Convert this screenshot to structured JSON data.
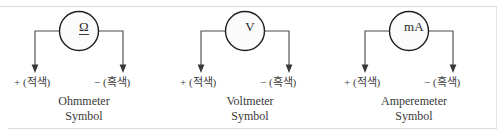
{
  "page": {
    "width": 503,
    "height": 138,
    "background_color": "#ffffff",
    "rule_color": "#d8d8d8"
  },
  "figures": [
    {
      "id": "ohmmeter",
      "meter_glyph": "Ω",
      "glyph_underlined": true,
      "positive_terminal": "+ (적색)",
      "negative_terminal": "− (흑색)",
      "caption_line1": "Ohmmeter",
      "caption_line2": "Symbol"
    },
    {
      "id": "voltmeter",
      "meter_glyph": "V",
      "glyph_underlined": false,
      "positive_terminal": "+ (적색)",
      "negative_terminal": "− (흑색)",
      "caption_line1": "Voltmeter",
      "caption_line2": "Symbol"
    },
    {
      "id": "amperemeter",
      "meter_glyph": "mA",
      "glyph_underlined": false,
      "positive_terminal": "+ (적색)",
      "negative_terminal": "− (흑색)",
      "caption_line1": "Amperemeter",
      "caption_line2": "Symbol"
    }
  ],
  "colors": {
    "circle_stroke": "#1f1f1f",
    "circle_fill": "#fbfbfb",
    "wire": "#444444",
    "text": "#333333"
  }
}
